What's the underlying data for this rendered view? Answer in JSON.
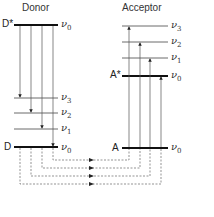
{
  "diagram": {
    "type": "energy-level-diagram",
    "donor": {
      "title": "Donor",
      "excited_label": "D*",
      "ground_label": "D",
      "levels": [
        {
          "label": "ν",
          "sub": "0",
          "state": "excited"
        },
        {
          "label": "ν",
          "sub": "3",
          "state": "ground"
        },
        {
          "label": "ν",
          "sub": "2",
          "state": "ground"
        },
        {
          "label": "ν",
          "sub": "1",
          "state": "ground"
        },
        {
          "label": "ν",
          "sub": "0",
          "state": "ground"
        }
      ]
    },
    "acceptor": {
      "title": "Acceptor",
      "excited_label": "A*",
      "ground_label": "A",
      "levels": [
        {
          "label": "ν",
          "sub": "3",
          "state": "excited"
        },
        {
          "label": "ν",
          "sub": "2",
          "state": "excited"
        },
        {
          "label": "ν",
          "sub": "1",
          "state": "excited"
        },
        {
          "label": "ν",
          "sub": "0",
          "state": "excited"
        },
        {
          "label": "ν",
          "sub": "0",
          "state": "ground"
        }
      ]
    },
    "transitions": {
      "donor_emissions": 4,
      "acceptor_absorptions": 4,
      "coupling_arrows": 4,
      "coupling_style": "dashed"
    },
    "colors": {
      "line": "#222222",
      "thin_line": "#555555",
      "dashed": "#666666"
    }
  }
}
